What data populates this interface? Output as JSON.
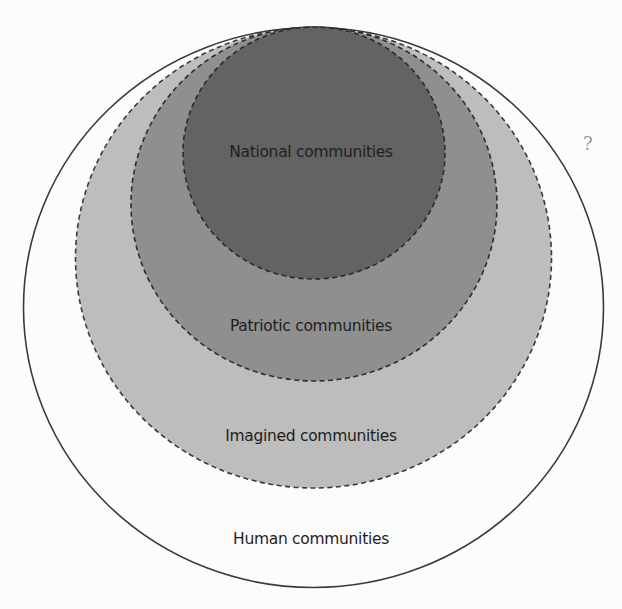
{
  "diagram": {
    "type": "nested-sets",
    "sets": [
      {
        "id": "human",
        "label": "Human communities",
        "fill": "#fcfcfc",
        "stroke": "#3a3a3a",
        "stroke_style": "solid",
        "cx": 313.5,
        "cy": 307.5,
        "rx": 290,
        "ry": 280,
        "label_y": 540
      },
      {
        "id": "imagined",
        "label": "Imagined communities",
        "fill": "#bdbdbd",
        "stroke": "#3a3a3a",
        "stroke_style": "dashed",
        "cx": 313.5,
        "cy": 258,
        "rx": 238,
        "ry": 230,
        "label_y": 437
      },
      {
        "id": "patriotic",
        "label": "Patriotic communities",
        "fill": "#8f8f8f",
        "stroke": "#2e2e2e",
        "stroke_style": "dashed",
        "cx": 314,
        "cy": 204,
        "rx": 183,
        "ry": 177,
        "label_y": 327
      },
      {
        "id": "national",
        "label": "National communities",
        "fill": "#636363",
        "stroke": "#2a2a2a",
        "stroke_style": "dashed",
        "cx": 314,
        "cy": 153,
        "rx": 131,
        "ry": 126,
        "label_y": 153
      }
    ],
    "stray_mark": "?"
  }
}
